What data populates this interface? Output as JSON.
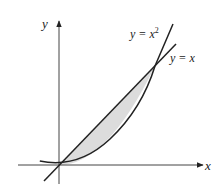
{
  "diagram": {
    "type": "region-between-curves",
    "axes": {
      "x_label": "x",
      "y_label": "y"
    },
    "curves": [
      {
        "name": "parabola",
        "equation_prefix": "y = x",
        "exponent": "2",
        "label": "y = x²"
      },
      {
        "name": "line",
        "equation": "y = x",
        "label": "y = x"
      }
    ],
    "shaded_region": {
      "between": [
        "y = x",
        "y = x²"
      ],
      "x_from": 0,
      "x_to": 1,
      "fill": "#dcdcdc"
    },
    "intersections": [
      [
        0,
        0
      ],
      [
        1,
        1
      ]
    ],
    "colors": {
      "stroke": "#222222",
      "shade": "#dcdcdc",
      "background": "#ffffff"
    }
  }
}
